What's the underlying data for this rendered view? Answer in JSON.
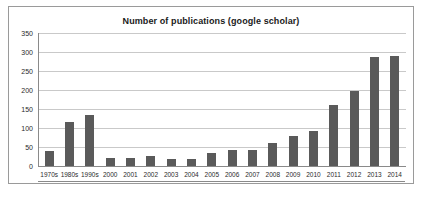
{
  "chart_data": {
    "type": "bar",
    "title": "Number of publications (google scholar)",
    "xlabel": "",
    "ylabel": "",
    "ylim": [
      0,
      350
    ],
    "yticks": [
      0,
      50,
      100,
      150,
      200,
      250,
      300,
      350
    ],
    "grid": true,
    "legend": null,
    "bar_color": "#5a5a5a",
    "categories": [
      "1970s",
      "1980s",
      "1990s",
      "2000",
      "2001",
      "2002",
      "2003",
      "2004",
      "2005",
      "2006",
      "2007",
      "2008",
      "2009",
      "2010",
      "2011",
      "2012",
      "2013",
      "2014"
    ],
    "values": [
      40,
      115,
      133,
      22,
      22,
      26,
      19,
      19,
      33,
      43,
      42,
      61,
      79,
      92,
      160,
      198,
      287,
      290
    ]
  },
  "frame": {
    "border_color": "#9a9a9a",
    "background": "#ffffff"
  }
}
